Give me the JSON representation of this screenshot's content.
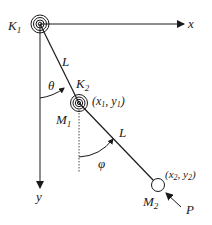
{
  "diagram": {
    "type": "double-pendulum-with-springs",
    "colors": {
      "line": "#1a1a1a",
      "background": "#ffffff"
    },
    "axes": {
      "x_label": "x",
      "y_label": "y"
    },
    "springs": [
      {
        "id": "K1",
        "label": "K",
        "sub": "1"
      },
      {
        "id": "K2",
        "label": "K",
        "sub": "2"
      }
    ],
    "masses": [
      {
        "id": "M1",
        "label": "M",
        "sub": "1",
        "coords": {
          "open": "(",
          "x": "x",
          "xsub": "1",
          "sep": ", ",
          "y": "y",
          "ysub": "1",
          "close": ")"
        }
      },
      {
        "id": "M2",
        "label": "M",
        "sub": "2",
        "coords": {
          "open": "(",
          "x": "x",
          "xsub": "2",
          "sep": ", ",
          "y": "y",
          "ysub": "2",
          "close": ")"
        }
      }
    ],
    "links": [
      {
        "id": "link1",
        "label": "L"
      },
      {
        "id": "link2",
        "label": "L"
      }
    ],
    "angles": [
      {
        "id": "theta",
        "label": "θ"
      },
      {
        "id": "phi",
        "label": "φ"
      }
    ],
    "force": {
      "label": "P"
    }
  }
}
